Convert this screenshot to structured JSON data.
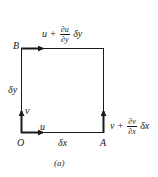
{
  "figure": {
    "caption": "(a)",
    "points": {
      "O": "O",
      "A": "A",
      "B": "B"
    },
    "edges": {
      "bottom_length": "δx",
      "left_length": "δy"
    },
    "velocities": {
      "O_u": "u",
      "O_v": "v",
      "B_top": {
        "base": "u +",
        "num": "∂u",
        "den": "∂y",
        "tail": "δy"
      },
      "A_right": {
        "base": "v +",
        "num": "∂v",
        "den": "∂x",
        "tail": "δx"
      }
    },
    "colors": {
      "line": "#1a1a1a",
      "background": "#ffffff"
    }
  }
}
